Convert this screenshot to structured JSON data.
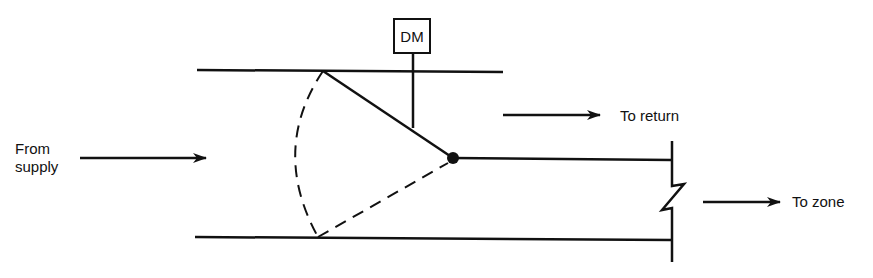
{
  "diagram": {
    "type": "damper-bypass-schematic",
    "labels": {
      "from_supply_line1": "From",
      "from_supply_line2": "supply",
      "to_return": "To return",
      "to_zone": "To zone",
      "damper_motor": "DM"
    },
    "components": [
      {
        "name": "supply-duct",
        "kind": "duct"
      },
      {
        "name": "damper-blade",
        "kind": "damper",
        "pivot": "pivot-point"
      },
      {
        "name": "damper-motor",
        "kind": "actuator",
        "label": "DM"
      },
      {
        "name": "return-branch",
        "kind": "duct-outlet"
      },
      {
        "name": "zone-branch",
        "kind": "duct-outlet",
        "break_symbol": true
      }
    ],
    "flows": [
      {
        "from": "supply",
        "to": "damper"
      },
      {
        "from": "damper",
        "to": "return"
      },
      {
        "from": "damper",
        "to": "zone"
      }
    ],
    "colors": {
      "ink": "#111111",
      "background": "#ffffff"
    }
  }
}
